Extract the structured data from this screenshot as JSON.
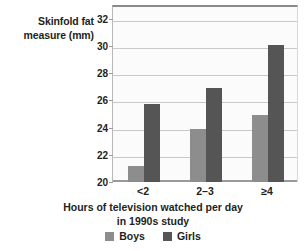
{
  "chart_data": {
    "type": "bar",
    "title": "",
    "subtitle": "",
    "categories": [
      "<2",
      "2–3",
      "≥4"
    ],
    "series": [
      {
        "name": "Boys",
        "color": "#8d8d8d",
        "values": [
          21.2,
          23.9,
          24.9
        ]
      },
      {
        "name": "Girls",
        "color": "#555555",
        "values": [
          25.7,
          26.9,
          30.1
        ]
      }
    ],
    "xlabel": "Hours of television watched per day in 1990s study",
    "ylabel": "Skinfold fat measure (mm)",
    "ylim": [
      20,
      33
    ],
    "yticks": [
      20,
      22,
      24,
      26,
      28,
      30,
      32
    ],
    "ytick_labels": [
      "20",
      "22",
      "24",
      "26",
      "28",
      "30",
      "32"
    ],
    "grid": true,
    "grid_axis": "y",
    "legend_position": "bottom"
  },
  "y_axis": {
    "title_line1": "Skinfold fat",
    "title_line2": "measure (mm)"
  },
  "x_axis": {
    "title_line1": "Hours of television watched per day",
    "title_line2": "in 1990s study",
    "cat_0": "<2",
    "cat_1": "2–3",
    "cat_2": "≥4"
  },
  "legend": {
    "boys_label": "Boys",
    "girls_label": "Girls",
    "boys_color": "#8d8d8d",
    "girls_color": "#555555"
  },
  "ytick_0": "20",
  "ytick_1": "22",
  "ytick_2": "24",
  "ytick_3": "26",
  "ytick_4": "28",
  "ytick_5": "30",
  "ytick_6": "32"
}
